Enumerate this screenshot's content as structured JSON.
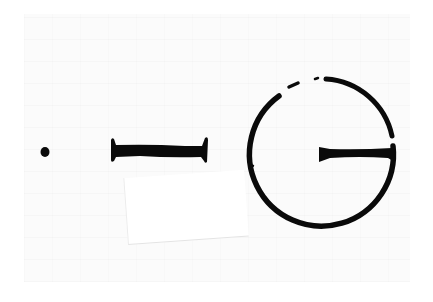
{
  "image": {
    "description": "Scanned ink drawing of three symbols on white paper",
    "width": 433,
    "height": 302,
    "colors": {
      "ink": "#0a0a0a",
      "paper": "#ffffff",
      "texture": "#fbfbfb",
      "scrap_edge": "#e6e6e6"
    },
    "symbols": [
      {
        "name": "dot",
        "shape": "circle",
        "cx": 45,
        "cy": 152,
        "r": 4.5
      },
      {
        "name": "bar",
        "shape": "i-beam",
        "x1": 111,
        "x2": 207,
        "cy": 150,
        "stem_thickness": 10,
        "end_height": 23
      },
      {
        "name": "circle-with-line",
        "shape": "circle",
        "cx": 323,
        "cy": 151,
        "r": 72,
        "stroke": 5,
        "inner_line": {
          "x1": 319,
          "x2": 393,
          "y": 154
        }
      }
    ],
    "paper_scrap": {
      "x": 128,
      "y": 178,
      "width": 120,
      "height": 66,
      "rotation_deg": -4
    }
  }
}
